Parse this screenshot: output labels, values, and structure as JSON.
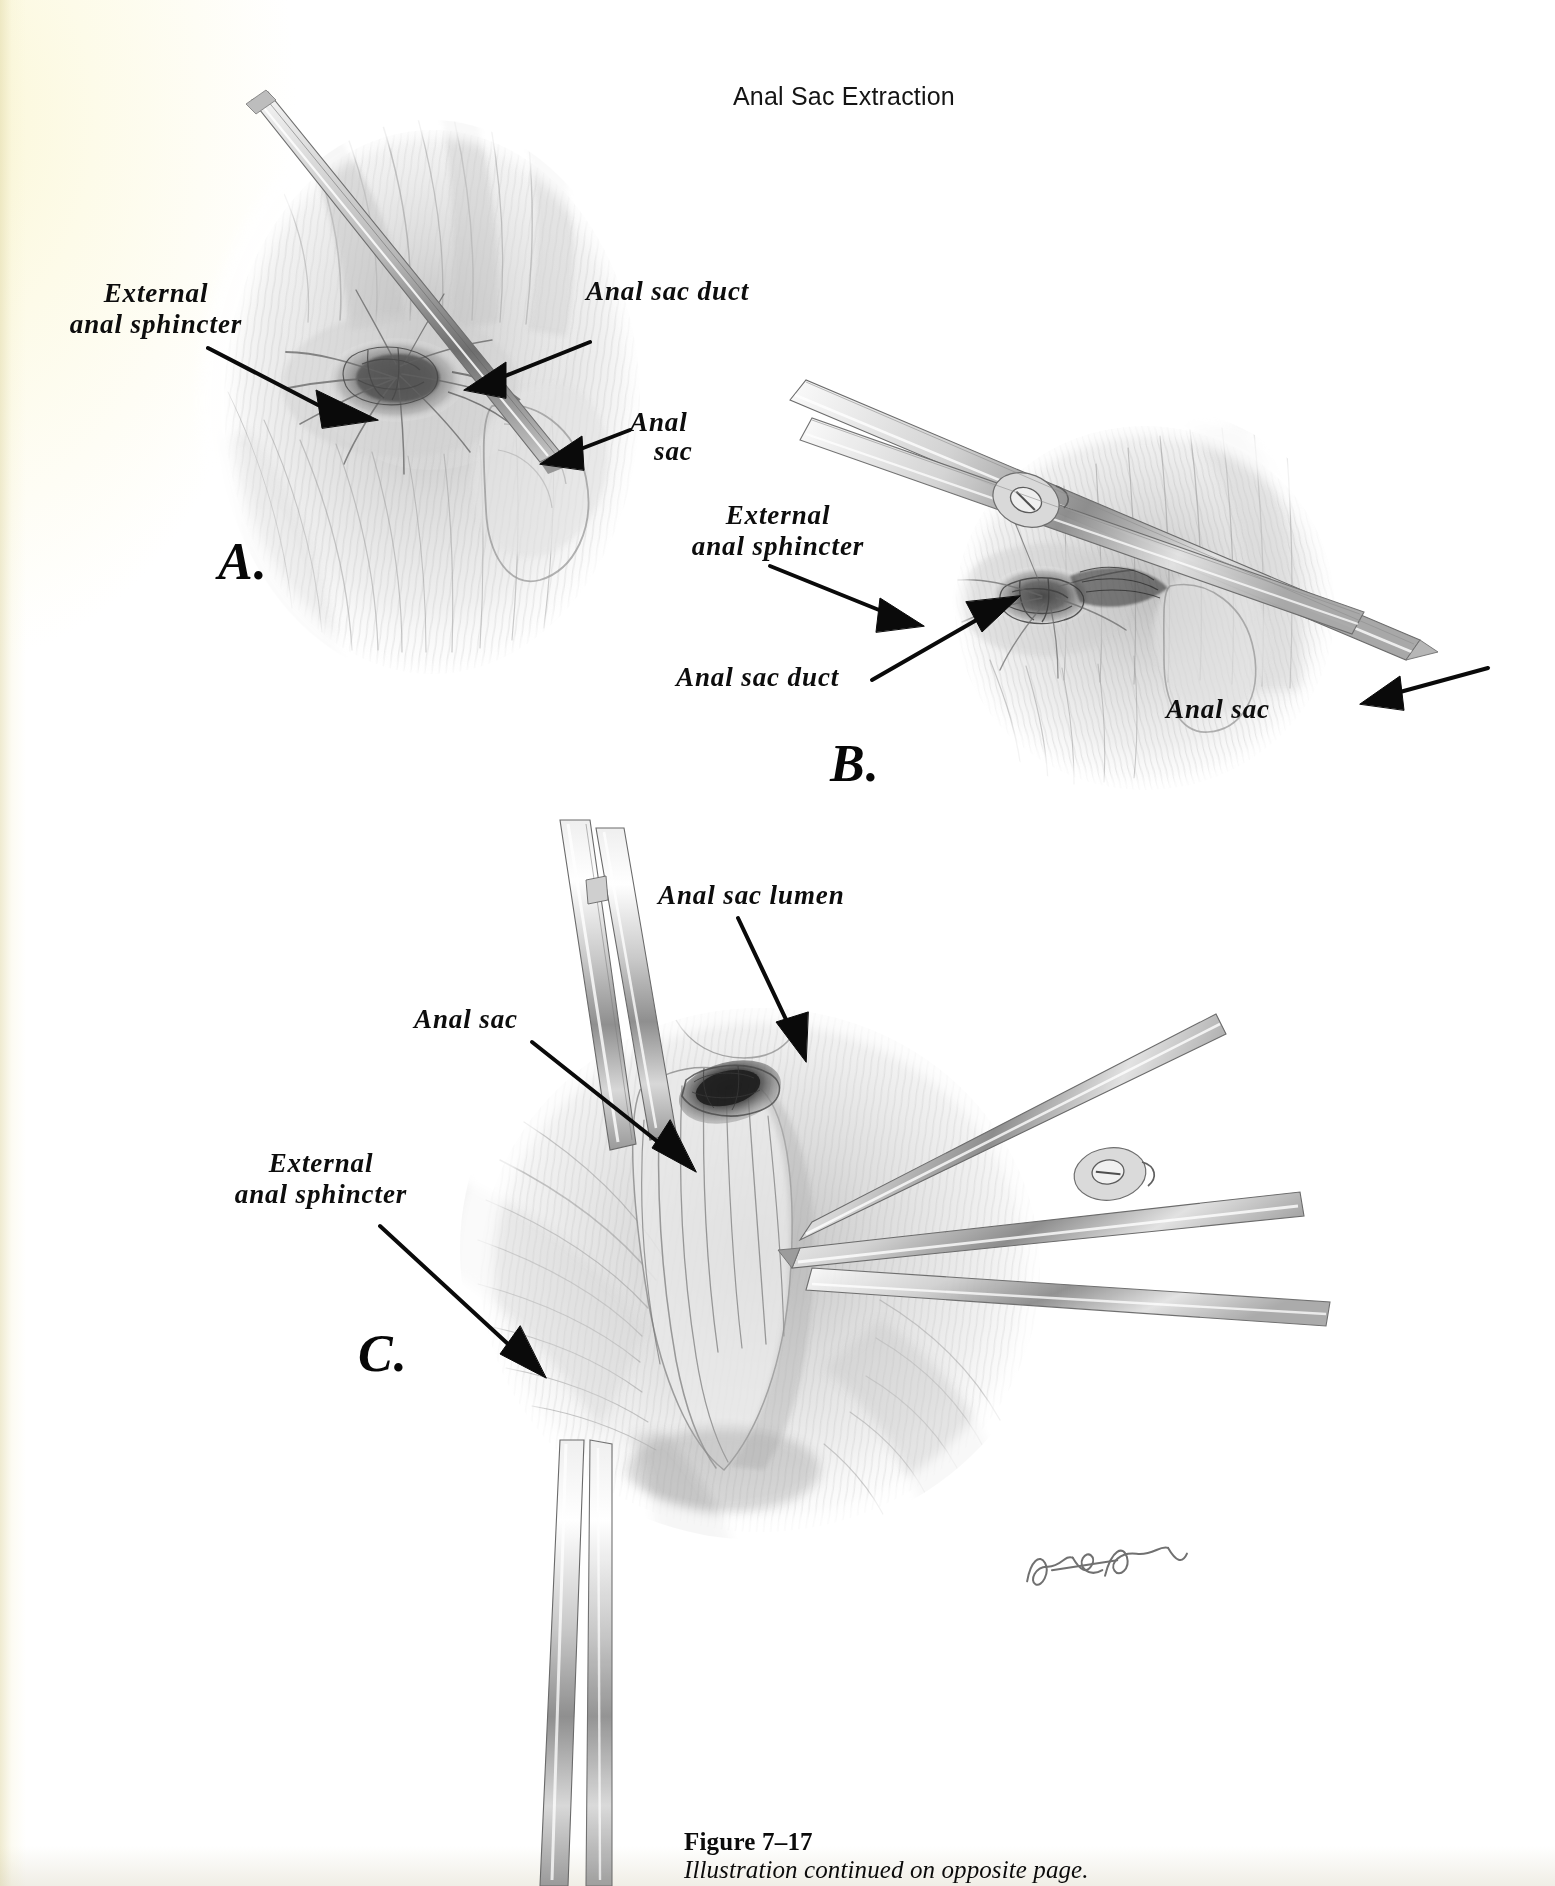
{
  "page": {
    "running_head": "Anal Sac Extraction",
    "paper_tint": "#fdfbe9",
    "ink": "#0d0d0d"
  },
  "figure": {
    "caption_title": "Figure 7–17",
    "caption_subtitle": "Illustration continued on opposite page.",
    "artist_signature": "Lloyd E. Toomer"
  },
  "panels": [
    {
      "id": "A",
      "letter": "A.",
      "description": "Anal sac duct cannulated with a probe; external anal sphincter and anal sac identified",
      "labels": [
        {
          "name": "external-anal-sphincter",
          "lines": [
            "External",
            "anal sphincter"
          ]
        },
        {
          "name": "anal-sac-duct",
          "lines": [
            "Anal sac duct"
          ]
        },
        {
          "name": "anal-sac",
          "lines": [
            "Anal",
            "sac"
          ]
        }
      ]
    },
    {
      "id": "B",
      "letter": "B.",
      "description": "Scissors dissecting along the probe through the external anal sphincter toward the anal sac",
      "labels": [
        {
          "name": "external-anal-sphincter",
          "lines": [
            "External",
            "anal sphincter"
          ]
        },
        {
          "name": "anal-sac-duct",
          "lines": [
            "Anal sac duct"
          ]
        },
        {
          "name": "anal-sac",
          "lines": [
            "Anal sac"
          ]
        }
      ]
    },
    {
      "id": "C",
      "letter": "C.",
      "description": "Anal sac incised and retracted with forceps exposing the lumen; scissors continue the dissection",
      "labels": [
        {
          "name": "anal-sac-lumen",
          "lines": [
            "Anal sac lumen"
          ]
        },
        {
          "name": "anal-sac",
          "lines": [
            "Anal sac"
          ]
        },
        {
          "name": "external-anal-sphincter",
          "lines": [
            "External",
            "anal sphincter"
          ]
        }
      ]
    }
  ]
}
